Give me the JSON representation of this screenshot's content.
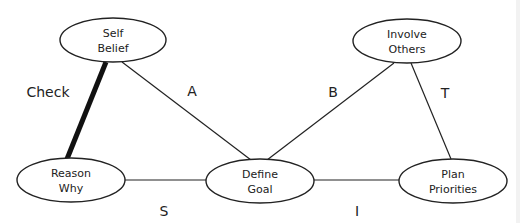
{
  "diagram": {
    "nodes": [
      {
        "id": "self-belief",
        "lines": [
          "Self",
          "Belief"
        ],
        "cx": 113,
        "cy": 40,
        "rx": 53,
        "ry": 22
      },
      {
        "id": "involve-others",
        "lines": [
          "Involve",
          "Others"
        ],
        "cx": 407,
        "cy": 41,
        "rx": 54,
        "ry": 22
      },
      {
        "id": "reason-why",
        "lines": [
          "Reason",
          "Why"
        ],
        "cx": 71,
        "cy": 180,
        "rx": 54,
        "ry": 22
      },
      {
        "id": "define-goal",
        "lines": [
          "Define",
          "Goal"
        ],
        "cx": 260,
        "cy": 181,
        "rx": 54,
        "ry": 22
      },
      {
        "id": "plan-priorities",
        "lines": [
          "Plan",
          "Priorities"
        ],
        "cx": 453,
        "cy": 181,
        "rx": 54,
        "ry": 22
      }
    ],
    "edges": [
      {
        "id": "check",
        "from": "self-belief",
        "to": "reason-why",
        "x1": 106,
        "y1": 62,
        "x2": 67,
        "y2": 159,
        "thick": true,
        "label": "Check",
        "lx": 48,
        "ly": 97
      },
      {
        "id": "a",
        "from": "self-belief",
        "to": "define-goal",
        "x1": 122,
        "y1": 62,
        "x2": 251,
        "y2": 160,
        "thick": false,
        "label": "A",
        "lx": 192,
        "ly": 96
      },
      {
        "id": "b",
        "from": "involve-others",
        "to": "define-goal",
        "x1": 394,
        "y1": 63,
        "x2": 267,
        "y2": 160,
        "thick": false,
        "label": "B",
        "lx": 333,
        "ly": 97
      },
      {
        "id": "t",
        "from": "involve-others",
        "to": "plan-priorities",
        "x1": 411,
        "y1": 63,
        "x2": 451,
        "y2": 159,
        "thick": false,
        "label": "T",
        "lx": 445,
        "ly": 98
      },
      {
        "id": "s",
        "from": "reason-why",
        "to": "define-goal",
        "x1": 125,
        "y1": 180,
        "x2": 206,
        "y2": 180,
        "thick": false,
        "label": "S",
        "lx": 164,
        "ly": 216
      },
      {
        "id": "i",
        "from": "define-goal",
        "to": "plan-priorities",
        "x1": 314,
        "y1": 180,
        "x2": 399,
        "y2": 180,
        "thick": false,
        "label": "I",
        "lx": 357,
        "ly": 216
      }
    ]
  }
}
